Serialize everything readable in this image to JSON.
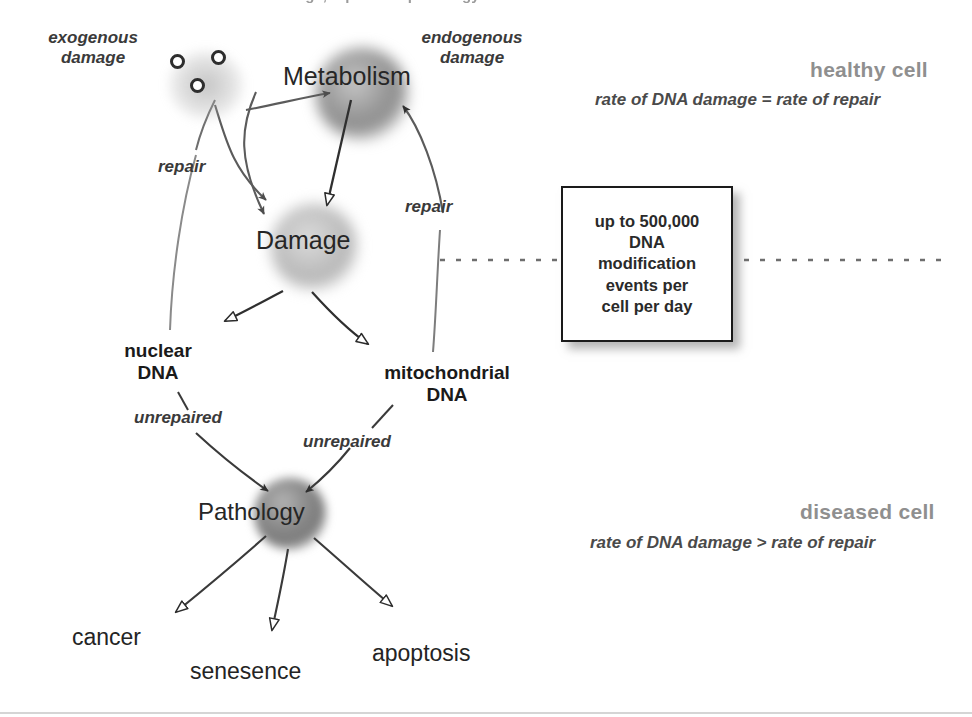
{
  "figure": {
    "title_cropped": "DNA damage, repair and pathology",
    "background_color": "#ffffff",
    "width": 972,
    "height": 717
  },
  "nodes": {
    "metabolism": {
      "label": "Metabolism",
      "color": "#8c8c8c"
    },
    "damage": {
      "label": "Damage",
      "color": "#b9b9b9"
    },
    "pathology": {
      "label": "Pathology",
      "color": "#7a7a7a"
    },
    "nuclear_dna": {
      "line1": "nuclear",
      "line2": "DNA"
    },
    "mitochondrial_dna": {
      "line1": "mitochondrial",
      "line2": "DNA"
    }
  },
  "source_labels": {
    "exogenous": {
      "line1": "exogenous",
      "line2": "damage"
    },
    "endogenous": {
      "line1": "endogenous",
      "line2": "damage"
    }
  },
  "edge_labels": {
    "repair_left": "repair",
    "repair_right": "repair",
    "unrepaired_nuclear": "unrepaired",
    "unrepaired_mitochondrial": "unrepaired"
  },
  "outcomes": [
    {
      "label": "cancer"
    },
    {
      "label": "senesence"
    },
    {
      "label": "apoptosis"
    }
  ],
  "callout": {
    "text": "up to 500,000\nDNA\nmodification\nevents per\ncell per day",
    "border_color": "#1a1a1a"
  },
  "cell_states": {
    "healthy": {
      "title": "healthy cell",
      "subtitle": "rate of DNA damage = rate of repair",
      "title_color": "#8f8f8f"
    },
    "diseased": {
      "title": "diseased cell",
      "subtitle": "rate of DNA damage > rate of repair",
      "title_color": "#8f8f8f"
    }
  },
  "divider": {
    "style": "dotted",
    "color": "#555555"
  }
}
